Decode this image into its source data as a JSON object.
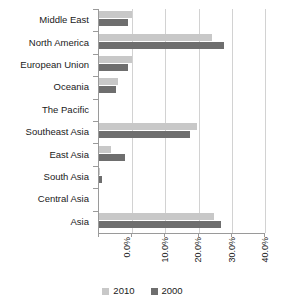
{
  "chart_data": {
    "type": "bar",
    "orientation": "horizontal",
    "title": "",
    "subtitle": "",
    "xlabel": "",
    "ylabel": "",
    "xlim": [
      0,
      50
    ],
    "xticks": [
      0,
      10,
      20,
      30,
      40,
      50
    ],
    "xtick_labels": [
      "0.0%",
      "10.0%",
      "20.0%",
      "30.0%",
      "40.0%",
      "50.0%"
    ],
    "grid": true,
    "grid_axis": "x",
    "legend_position": "bottom",
    "categories": [
      "Middle East",
      "North America",
      "European Union",
      "Oceania",
      "The Pacific",
      "Southeast Asia",
      "East Asia",
      "South Asia",
      "Central Asia",
      "Asia"
    ],
    "series": [
      {
        "name": "2010",
        "color": "#c8c8c8",
        "values": [
          10.0,
          34.0,
          10.0,
          5.7,
          0.0,
          29.5,
          3.6,
          0.3,
          0.0,
          34.6
        ]
      },
      {
        "name": "2000",
        "color": "#6e6e6e",
        "values": [
          8.7,
          37.8,
          8.7,
          5.1,
          0.0,
          27.4,
          7.8,
          1.0,
          0.0,
          36.7
        ]
      }
    ]
  },
  "legend": {
    "items": [
      {
        "label": "2010",
        "color": "#c8c8c8"
      },
      {
        "label": "2000",
        "color": "#6e6e6e"
      }
    ]
  },
  "colors": {
    "series_2010": "#c8c8c8",
    "series_2000": "#6e6e6e",
    "axis": "#9a9a9a",
    "gridline": "#d2d2d2",
    "background": "#ffffff",
    "text": "#1a1a1a"
  }
}
